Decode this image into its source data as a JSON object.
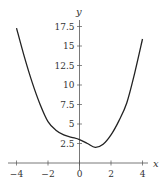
{
  "chart_data": {
    "type": "line",
    "title": "",
    "xlabel": "x",
    "ylabel": "y",
    "xlim": [
      -4,
      4
    ],
    "ylim": [
      0,
      18
    ],
    "xticks": [
      -4,
      -2,
      0,
      2,
      4
    ],
    "xtick_labels": [
      "−4",
      "−2",
      "0",
      "2",
      "4"
    ],
    "yticks": [
      2.5,
      5,
      7.5,
      10,
      12.5,
      15,
      17.5
    ],
    "ytick_labels": [
      "2.5",
      "5",
      "7.5",
      "10",
      "12.5",
      "15",
      "17.5"
    ],
    "grid": false,
    "legend": null,
    "series": [
      {
        "name": "f(x)",
        "color": "#222222",
        "x": [
          -4,
          -3.5,
          -3,
          -2.5,
          -2,
          -1.5,
          -1,
          -0.5,
          0,
          0.5,
          1,
          1.5,
          2,
          2.5,
          3,
          3.5,
          4
        ],
        "y": [
          17.3,
          13.6,
          10.3,
          7.5,
          5.3,
          4.2,
          3.6,
          3.3,
          3.0,
          2.5,
          2.0,
          2.4,
          3.6,
          5.4,
          7.7,
          11.5,
          15.9
        ]
      }
    ]
  }
}
